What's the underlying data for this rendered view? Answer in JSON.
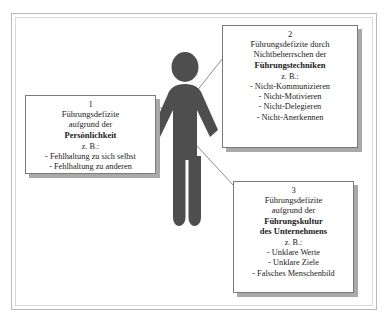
{
  "diagram": {
    "title_alt": "Fuehrungsdefizite Diagramm",
    "figure": {
      "name": "person-pictogram",
      "color": "#4a4a4a"
    },
    "frame": {
      "border_color": "#b9b9b9",
      "background": "#ffffff"
    },
    "boxes": [
      {
        "number": "1",
        "heading_lines": [
          "Führungsdefizite",
          "aufgrund der"
        ],
        "bold_lines": [
          "Persönlichkeit"
        ],
        "example_label": "z. B.:",
        "items": [
          "- Fehlhaltung zu sich selbst",
          "- Fehlhaltung zu anderen"
        ]
      },
      {
        "number": "2",
        "heading_lines": [
          "Führungsdefizite durch",
          "Nichtbeherrschen der"
        ],
        "bold_lines": [
          "Führungstechniken"
        ],
        "example_label": "z. B.:",
        "items": [
          "- Nicht-Kommunizieren",
          "- Nicht-Motivieren",
          "- Nicht-Delegieren",
          "- Nicht-Anerkennen"
        ]
      },
      {
        "number": "3",
        "heading_lines": [
          "Führungsdefizite",
          "aufgrund der"
        ],
        "bold_lines": [
          "Führungskultur",
          "des Unternehmens"
        ],
        "example_label": "z. B.:",
        "items": [
          "- Unklare Werte",
          "- Unklare Ziele",
          "- Falsches Menschenbild"
        ]
      }
    ],
    "connectors": [
      {
        "name": "connector-person-to-box2",
        "from": [
          196,
          92
        ],
        "to": [
          223,
          58
        ]
      },
      {
        "name": "connector-person-to-box3",
        "from": [
          197,
          146
        ],
        "to": [
          234,
          186
        ]
      },
      {
        "name": "connector-person-to-box1",
        "from": [
          160,
          108
        ],
        "to": [
          152,
          108
        ]
      }
    ]
  }
}
